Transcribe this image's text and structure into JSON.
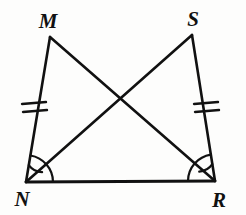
{
  "figure": {
    "background_color": "#fdfdfc",
    "stroke_color": "#111111",
    "canvas": {
      "width": 246,
      "height": 215
    }
  },
  "vertices": [
    {
      "id": "M",
      "label": "M",
      "x": 50,
      "y": 37,
      "label_x": 48,
      "label_y": 21
    },
    {
      "id": "S",
      "label": "S",
      "x": 192,
      "y": 35,
      "label_x": 193,
      "label_y": 19
    },
    {
      "id": "N",
      "label": "N",
      "x": 26,
      "y": 182,
      "label_x": 22,
      "label_y": 199
    },
    {
      "id": "R",
      "label": "R",
      "x": 215,
      "y": 181,
      "label_x": 219,
      "label_y": 200
    }
  ],
  "segments": [
    {
      "id": "MN",
      "from": "M",
      "to": "N",
      "x1": 50,
      "y1": 37,
      "x2": 26,
      "y2": 182,
      "ticks": 2
    },
    {
      "id": "SR",
      "from": "S",
      "to": "R",
      "x1": 192,
      "y1": 35,
      "x2": 215,
      "y2": 181,
      "ticks": 2
    },
    {
      "id": "NR",
      "from": "N",
      "to": "R",
      "x1": 26,
      "y1": 182,
      "x2": 215,
      "y2": 181,
      "ticks": 0
    },
    {
      "id": "MR",
      "from": "M",
      "to": "R",
      "x1": 50,
      "y1": 37,
      "x2": 215,
      "y2": 181,
      "ticks": 0
    },
    {
      "id": "SN",
      "from": "S",
      "to": "N",
      "x1": 192,
      "y1": 35,
      "x2": 26,
      "y2": 182,
      "ticks": 0
    }
  ],
  "intersection": {
    "id": "MR-SN-crossing",
    "x": 118,
    "y": 97
  },
  "angle_marks": [
    {
      "id": "angle-N-inner",
      "vertex": "N",
      "radius": 17,
      "note": "arc between NM and NS"
    },
    {
      "id": "angle-N-outer",
      "vertex": "N",
      "radius": 27,
      "note": "arc between NM and NR"
    },
    {
      "id": "angle-R-inner",
      "vertex": "R",
      "radius": 17,
      "note": "arc between RS and RM"
    },
    {
      "id": "angle-R-outer",
      "vertex": "R",
      "radius": 27,
      "note": "arc between RS and RN"
    }
  ],
  "tick_marks": {
    "count_per_side": 2,
    "sides": [
      "MN",
      "SR"
    ],
    "description": "double congruence hash marks"
  }
}
